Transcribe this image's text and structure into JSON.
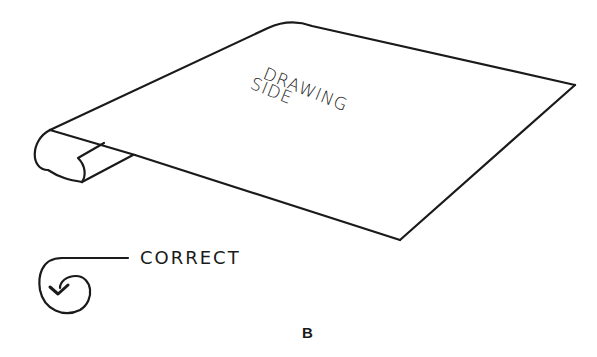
{
  "figure": {
    "sheet_label_line1": "DRAWING",
    "sheet_label_line2": "SIDE",
    "roll_direction_label": "CORRECT",
    "caption": "B",
    "ink_color": "#1a1a1a",
    "background": "#ffffff"
  }
}
